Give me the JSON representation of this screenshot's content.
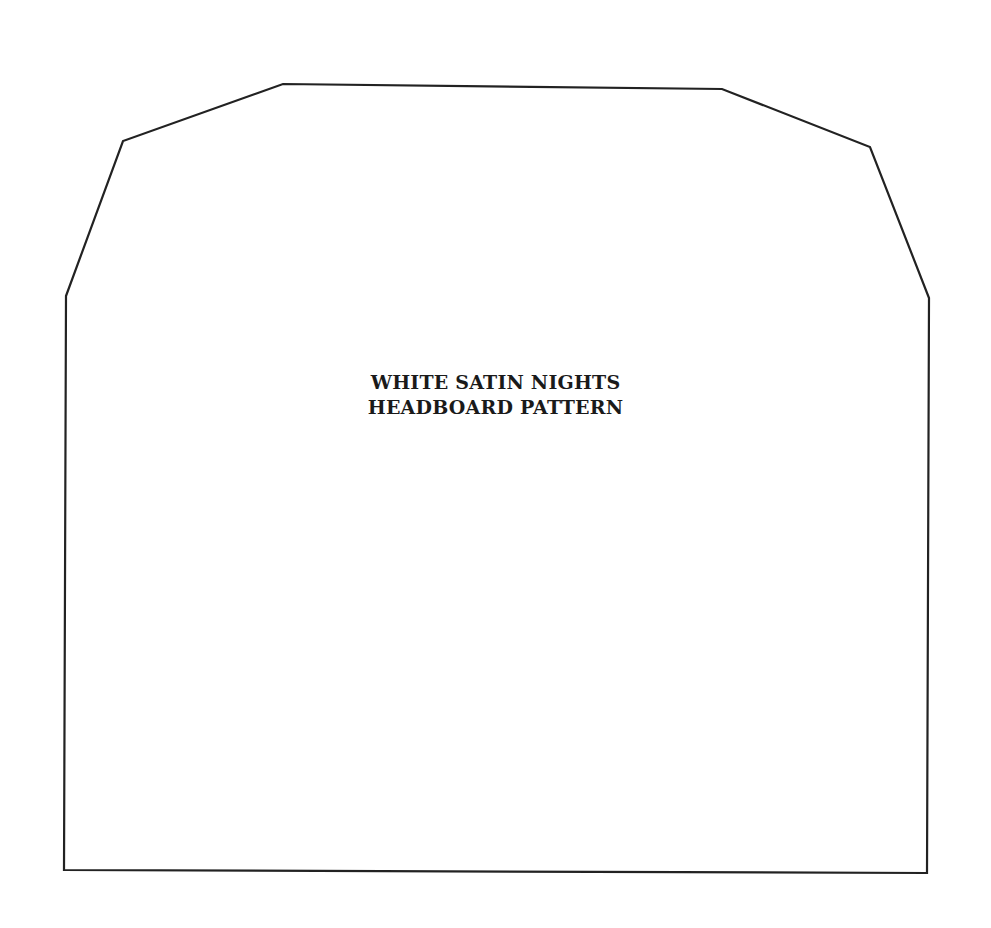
{
  "diagram": {
    "title_line_1": "WHITE SATIN NIGHTS",
    "title_line_2": "HEADBOARD PATTERN",
    "outline_color": "#222222",
    "background": "#ffffff",
    "outline_points": "66,296 123,141 283,84 722,89 870,147 929,298 927,873 64,870"
  }
}
